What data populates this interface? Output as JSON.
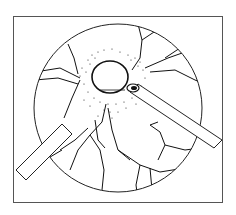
{
  "figure": {
    "type": "line-illustration",
    "colors": {
      "line": "#111111",
      "background": "#ffffff",
      "frame": "#555555"
    }
  }
}
